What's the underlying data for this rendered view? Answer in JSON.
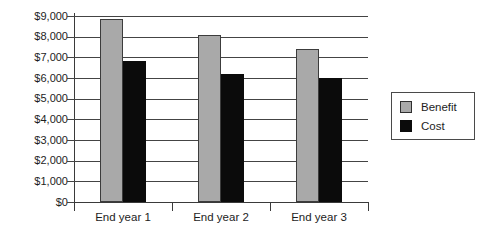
{
  "chart_data": {
    "type": "bar",
    "title": "",
    "xlabel": "",
    "ylabel": "",
    "categories": [
      "End year 1",
      "End year 2",
      "End year 3"
    ],
    "series": [
      {
        "name": "Benefit",
        "color": "#a9a9a9",
        "values": [
          8850,
          8100,
          7400
        ]
      },
      {
        "name": "Cost",
        "color": "#0b0b0b",
        "values": [
          6800,
          6200,
          6000
        ]
      }
    ],
    "ylim": [
      0,
      9000
    ],
    "ytick_step": 1000,
    "ytick_labels": [
      "$0",
      "$1,000",
      "$2,000",
      "$3,000",
      "$4,000",
      "$5,000",
      "$6,000",
      "$7,000",
      "$8,000",
      "$9,000"
    ],
    "ytick_values": [
      0,
      1000,
      2000,
      3000,
      4000,
      5000,
      6000,
      7000,
      8000,
      9000
    ],
    "grid": true,
    "grid_axis": "y",
    "legend": true,
    "legend_position": "right",
    "legend_entries": [
      "Benefit",
      "Cost"
    ]
  },
  "legend": {
    "items": [
      {
        "label": "Benefit"
      },
      {
        "label": "Cost"
      }
    ]
  }
}
